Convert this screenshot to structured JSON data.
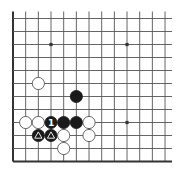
{
  "board": {
    "type": "go-corner-diagram",
    "corner": "bottom-left",
    "columns": 13,
    "rows": 12,
    "origin_x": 13,
    "origin_y": 18.5,
    "col_spacing": 12.67,
    "row_spacing": 13.0,
    "open_top_extend": 7,
    "open_right_extend": 7,
    "colors": {
      "background": "#ffffff",
      "line": "#555555",
      "border": "#333333",
      "black_stone": "#1a1a1a",
      "white_stone": "#ffffff",
      "white_stone_edge": "#444444",
      "marker_on_black": "#ffffff"
    },
    "star_points": [
      {
        "col": 3,
        "row": 2
      },
      {
        "col": 9,
        "row": 2
      },
      {
        "col": 9,
        "row": 8
      }
    ],
    "stones": [
      {
        "color": "white",
        "col": 2,
        "row": 5,
        "label": ""
      },
      {
        "color": "black",
        "col": 5,
        "row": 6,
        "label": ""
      },
      {
        "color": "white",
        "col": 1,
        "row": 8,
        "label": ""
      },
      {
        "color": "white",
        "col": 2,
        "row": 8,
        "label": ""
      },
      {
        "color": "black",
        "col": 3,
        "row": 8,
        "label": "1"
      },
      {
        "color": "black",
        "col": 4,
        "row": 8,
        "label": ""
      },
      {
        "color": "black",
        "col": 5,
        "row": 8,
        "label": ""
      },
      {
        "color": "white",
        "col": 6,
        "row": 8,
        "label": ""
      },
      {
        "color": "black",
        "col": 2,
        "row": 9,
        "label": "triangle"
      },
      {
        "color": "black",
        "col": 3,
        "row": 9,
        "label": "triangle"
      },
      {
        "color": "white",
        "col": 4,
        "row": 9,
        "label": ""
      },
      {
        "color": "white",
        "col": 6,
        "row": 9,
        "label": ""
      },
      {
        "color": "white",
        "col": 4,
        "row": 10,
        "label": ""
      }
    ]
  }
}
